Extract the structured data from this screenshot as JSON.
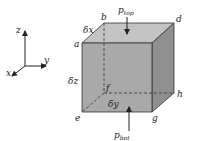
{
  "diagram": {
    "axes": {
      "x": "x",
      "y": "y",
      "z": "z"
    },
    "vertices": {
      "a": "a",
      "b": "b",
      "d": "d",
      "e": "e",
      "f": "f",
      "g": "g",
      "h": "h"
    },
    "dimensions": {
      "dx": "δx",
      "dy": "δy",
      "dz": "δz"
    },
    "forces": {
      "top": {
        "symbol": "p",
        "subscript": "top"
      },
      "bottom": {
        "symbol": "p",
        "subscript": "bot"
      }
    },
    "colors": {
      "front_face": "#a9a9a9",
      "top_face": "#c4c4c4",
      "side_face": "#8f8f8f",
      "edge": "#333333"
    }
  }
}
